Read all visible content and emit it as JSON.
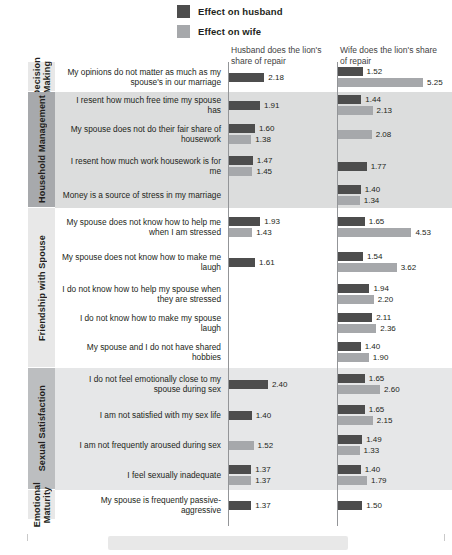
{
  "legend": {
    "items": [
      {
        "label": "Effect on husband",
        "color": "#4d4d4d",
        "key": "husband"
      },
      {
        "label": "Effect on wife",
        "color": "#a6a8ab",
        "key": "wife"
      }
    ]
  },
  "columns": [
    {
      "id": "left",
      "header": "Husband does the lion's share of repair"
    },
    {
      "id": "right",
      "header": "Wife does the lion's share of repair"
    }
  ],
  "categories": [
    {
      "name": "Decision Making",
      "rows": 1,
      "shade": "light"
    },
    {
      "name": "Household Management",
      "rows": 4,
      "shade": "dark"
    },
    {
      "name": "Friendship with Spouse",
      "rows": 5,
      "shade": "light"
    },
    {
      "name": "Sexual Satisfaction",
      "rows": 4,
      "shade": "mid"
    },
    {
      "name": "Emotional Maturity",
      "rows": 1,
      "shade": "light"
    }
  ],
  "chart_data": {
    "type": "bar",
    "title": "",
    "xlabel": "",
    "ylabel": "",
    "xlim": [
      0,
      5.6
    ],
    "grid": false,
    "legend_position": "top",
    "categories": [
      "My opinions do not matter as much as my spouse's in our marriage",
      "I resent how much free time my spouse has",
      "My spouse does not do their fair share of housework",
      "I resent how much work housework is for me",
      "Money is a source of stress in my marriage",
      "My spouse does not know how to help me when I am stressed",
      "My spouse does not know how to make me laugh",
      "I do not know how to help my spouse when they are stressed",
      "I do not know how to make my spouse laugh",
      "My spouse and I do not have shared hobbies",
      "I do not feel emotionally close to my spouse during sex",
      "I am not satisfied with my sex life",
      "I am not frequently aroused during sex",
      "I feel sexually inadequate",
      "My spouse is frequently passive-aggressive"
    ],
    "panels": [
      {
        "name": "Husband does the lion's share of repair",
        "series": [
          {
            "name": "Effect on husband",
            "values": [
              2.18,
              1.91,
              1.6,
              1.47,
              null,
              1.93,
              1.61,
              null,
              null,
              null,
              2.4,
              1.4,
              null,
              1.37,
              1.37
            ]
          },
          {
            "name": "Effect on wife",
            "values": [
              null,
              null,
              1.38,
              1.45,
              null,
              1.43,
              null,
              null,
              null,
              null,
              null,
              null,
              1.52,
              1.37,
              null
            ]
          }
        ]
      },
      {
        "name": "Wife does the lion's share of repair",
        "series": [
          {
            "name": "Effect on husband",
            "values": [
              1.52,
              1.44,
              null,
              1.77,
              1.4,
              1.65,
              1.54,
              1.94,
              2.11,
              1.4,
              1.65,
              1.65,
              1.49,
              1.4,
              1.5
            ]
          },
          {
            "name": "Effect on wife",
            "values": [
              5.25,
              2.13,
              2.08,
              null,
              1.34,
              4.53,
              3.62,
              2.2,
              2.36,
              1.9,
              2.6,
              2.15,
              1.33,
              1.79,
              null
            ]
          }
        ]
      }
    ]
  }
}
